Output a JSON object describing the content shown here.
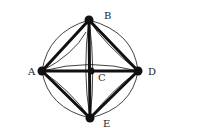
{
  "diagram": {
    "type": "graph",
    "nodes": [
      {
        "id": "A",
        "label": "A",
        "x": 42,
        "y": 71,
        "lx": 28,
        "ly": 75
      },
      {
        "id": "B",
        "label": "B",
        "x": 89,
        "y": 20,
        "lx": 104,
        "ly": 19
      },
      {
        "id": "C",
        "label": "C",
        "x": 91,
        "y": 71,
        "lx": 98,
        "ly": 81
      },
      {
        "id": "D",
        "label": "D",
        "x": 138,
        "y": 71,
        "lx": 148,
        "ly": 75
      },
      {
        "id": "E",
        "label": "E",
        "x": 90,
        "y": 118,
        "lx": 103,
        "ly": 127
      }
    ],
    "thick_edges": [
      [
        "A",
        "B"
      ],
      [
        "B",
        "D"
      ],
      [
        "D",
        "E"
      ],
      [
        "E",
        "A"
      ],
      [
        "A",
        "D"
      ],
      [
        "B",
        "E"
      ]
    ],
    "thin_edges": [
      [
        "A",
        "B"
      ],
      [
        "B",
        "D"
      ],
      [
        "D",
        "E"
      ],
      [
        "E",
        "A"
      ],
      [
        "A",
        "D"
      ],
      [
        "B",
        "E"
      ]
    ],
    "colors": {
      "stroke": "#111111",
      "background": "#ffffff"
    }
  }
}
